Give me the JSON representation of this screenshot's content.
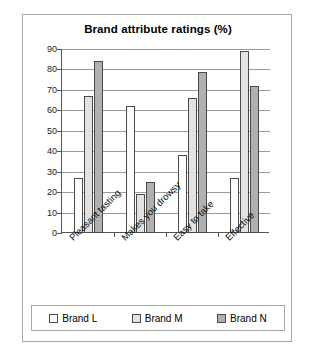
{
  "chart_data": {
    "type": "bar",
    "title": "Brand attribute ratings (%)",
    "xlabel": "",
    "ylabel": "",
    "ylim": [
      0,
      90
    ],
    "yticks": [
      0,
      10,
      20,
      30,
      40,
      50,
      60,
      70,
      80,
      90
    ],
    "grid": true,
    "legend_position": "bottom",
    "categories": [
      "Pleasant tasting",
      "Makes you drowsy",
      "Easy to take",
      "Effective"
    ],
    "series": [
      {
        "name": "Brand L",
        "color": "#fdfdfd",
        "values": [
          27,
          62,
          38,
          27
        ]
      },
      {
        "name": "Brand M",
        "color": "#e2e2e2",
        "values": [
          67,
          19,
          66,
          89
        ]
      },
      {
        "name": "Brand N",
        "color": "#b0b0b0",
        "values": [
          84,
          25,
          79,
          72
        ]
      }
    ]
  },
  "style": {
    "border_color": "#a8a8a8",
    "axis_color": "#555555",
    "grid_color": "#9a9a9a",
    "bar_outline": "#4a4a4a"
  }
}
